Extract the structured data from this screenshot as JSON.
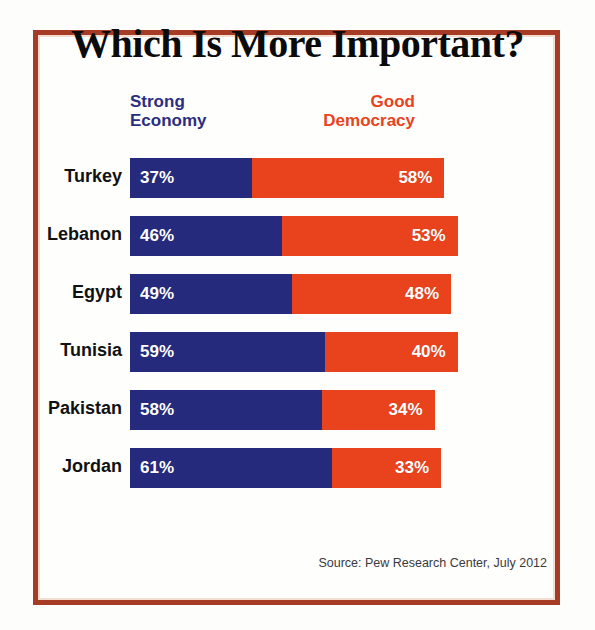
{
  "chart_data": {
    "type": "bar",
    "subtype": "stacked-horizontal-100",
    "title": "Which Is More Important?",
    "xlabel": "",
    "ylabel": "",
    "categories": [
      "Turkey",
      "Lebanon",
      "Egypt",
      "Tunisia",
      "Pakistan",
      "Jordan"
    ],
    "series": [
      {
        "name": "Strong Economy",
        "color": "#262a7d",
        "values": [
          37,
          46,
          49,
          59,
          58,
          61
        ],
        "value_labels": [
          "37%",
          "46%",
          "49%",
          "59%",
          "58%",
          "61%"
        ]
      },
      {
        "name": "Good Democracy",
        "color": "#e8431c",
        "values": [
          58,
          53,
          48,
          40,
          34,
          33
        ],
        "value_labels": [
          "58%",
          "53%",
          "48%",
          "40%",
          "34%",
          "33%"
        ]
      }
    ],
    "xlim": [
      0,
      97
    ],
    "grid": false,
    "legend_position": "top",
    "annotations": [
      "Source: Pew Research Center, July 2012"
    ]
  },
  "title": "Which Is More Important?",
  "legend": {
    "economy": {
      "line1": "Strong",
      "line2": "Economy",
      "color": "#2b2d7f"
    },
    "democracy": {
      "line1": "Good",
      "line2": "Democracy",
      "color": "#e8431c"
    }
  },
  "rows": [
    {
      "label": "Turkey",
      "economy": "37%",
      "democracy": "58%",
      "economy_pct": 37,
      "democracy_pct": 58
    },
    {
      "label": "Lebanon",
      "economy": "46%",
      "democracy": "53%",
      "economy_pct": 46,
      "democracy_pct": 53
    },
    {
      "label": "Egypt",
      "economy": "49%",
      "democracy": "48%",
      "economy_pct": 49,
      "democracy_pct": 48
    },
    {
      "label": "Tunisia",
      "economy": "59%",
      "democracy": "40%",
      "economy_pct": 59,
      "democracy_pct": 40
    },
    {
      "label": "Pakistan",
      "economy": "58%",
      "democracy": "34%",
      "economy_pct": 58,
      "democracy_pct": 34
    },
    {
      "label": "Jordan",
      "economy": "61%",
      "democracy": "33%",
      "economy_pct": 61,
      "democracy_pct": 33
    }
  ],
  "source": "Source: Pew Research Center, July 2012",
  "colors": {
    "economy": "#262a7d",
    "democracy": "#e8431c",
    "frame": "#a63c26",
    "title": "#0b0b0b",
    "background": "#fefefd"
  },
  "scale": {
    "px_per_percent": 3.31
  }
}
